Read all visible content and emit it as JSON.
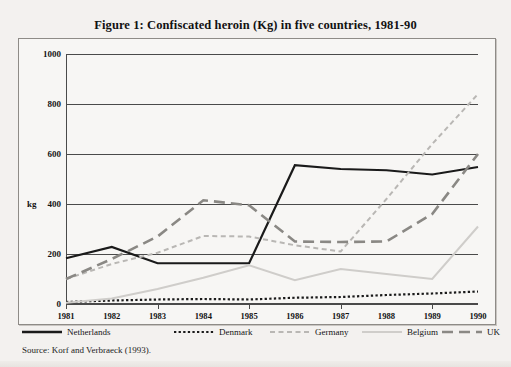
{
  "figure": {
    "title": "Figure 1: Confiscated heroin (Kg) in five countries, 1981-90",
    "source": "Source: Korf and Verbraeck (1993)."
  },
  "chart_data": {
    "type": "line",
    "title": "Figure 1: Confiscated heroin (Kg) in five countries, 1981-90",
    "xlabel": "",
    "ylabel": "kg",
    "x": [
      1981,
      1982,
      1983,
      1984,
      1985,
      1986,
      1987,
      1988,
      1989,
      1990
    ],
    "xtick_labels": [
      "1981",
      "1982",
      "1983",
      "1984",
      "1985",
      "1986",
      "1987",
      "1988",
      "1989",
      "1990"
    ],
    "ytick_labels": [
      "0",
      "200",
      "400",
      "600",
      "800",
      "1000"
    ],
    "yticks": [
      0,
      200,
      400,
      600,
      800,
      1000
    ],
    "ylim": [
      0,
      1000
    ],
    "grid": true,
    "legend_position": "bottom",
    "series": [
      {
        "name": "Netherlands",
        "color": "#1a1a1a",
        "style": "solid",
        "width": 2.2,
        "values": [
          183,
          228,
          163,
          163,
          163,
          555,
          540,
          535,
          518,
          548
        ]
      },
      {
        "name": "Denmark",
        "color": "#1a1a1a",
        "style": "dotted",
        "width": 2.2,
        "values": [
          8,
          14,
          18,
          20,
          18,
          25,
          28,
          36,
          42,
          50
        ]
      },
      {
        "name": "Germany",
        "color": "#b9b7b4",
        "style": "dashed-fine",
        "width": 2.0,
        "values": [
          100,
          160,
          205,
          272,
          270,
          235,
          210,
          420,
          640,
          840
        ]
      },
      {
        "name": "Belgium",
        "color": "#cfcdca",
        "style": "solid",
        "width": 2.0,
        "values": [
          5,
          22,
          60,
          105,
          155,
          95,
          140,
          120,
          100,
          310
        ]
      },
      {
        "name": "UK",
        "color": "#8a8884",
        "style": "dashed-coarse",
        "width": 2.6,
        "values": [
          100,
          180,
          270,
          415,
          395,
          250,
          248,
          250,
          360,
          600
        ]
      }
    ]
  },
  "legend": {
    "items": [
      {
        "label": "Netherlands",
        "style": "solid-thick",
        "color": "#1a1a1a"
      },
      {
        "label": "Denmark",
        "style": "dotted",
        "color": "#1a1a1a"
      },
      {
        "label": "Germany",
        "style": "dashed-fine",
        "color": "#b9b7b4"
      },
      {
        "label": "Belgium",
        "style": "solid-light",
        "color": "#cfcdca"
      },
      {
        "label": "UK",
        "style": "dashed-coarse",
        "color": "#8a8884"
      }
    ]
  }
}
